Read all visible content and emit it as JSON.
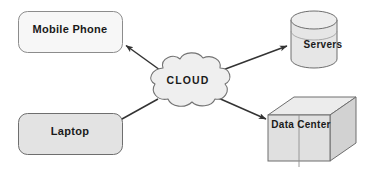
{
  "diagram": {
    "background_color": "#ffffff",
    "stroke_color": "#4d4d4d",
    "arrow_color": "#333333",
    "text_color": "#1a1a1a",
    "nodes": [
      {
        "id": "mobile-phone",
        "label": "Mobile Phone",
        "shape": "rounded-rectangle",
        "fill": "#f7f7f7",
        "stroke": "#8c8c8c"
      },
      {
        "id": "laptop",
        "label": "Laptop",
        "shape": "rounded-rectangle",
        "fill": "#e3e3e3",
        "stroke": "#6e6e6e"
      },
      {
        "id": "cloud",
        "label": "CLOUD",
        "shape": "cloud",
        "fill": "#efefef",
        "stroke": "#737373"
      },
      {
        "id": "servers",
        "label": "Servers",
        "shape": "cylinder",
        "fill": "#e6e6e6",
        "stroke": "#6e6e6e"
      },
      {
        "id": "data-center",
        "label": "Data Center",
        "shape": "cube",
        "fill": "#e0e0e0",
        "fill_top": "#ececec",
        "fill_side": "#d2d2d2",
        "stroke": "#6e6e6e"
      }
    ],
    "connections": [
      {
        "id": "cloud-to-mobile-phone",
        "from": "cloud",
        "to": "mobile-phone",
        "direction": "to"
      },
      {
        "id": "cloud-to-servers",
        "from": "cloud",
        "to": "servers",
        "direction": "to"
      },
      {
        "id": "cloud-to-laptop",
        "from": "cloud",
        "to": "laptop",
        "direction": "to"
      },
      {
        "id": "cloud-to-data-center",
        "from": "cloud",
        "to": "data-center",
        "direction": "to"
      }
    ]
  }
}
